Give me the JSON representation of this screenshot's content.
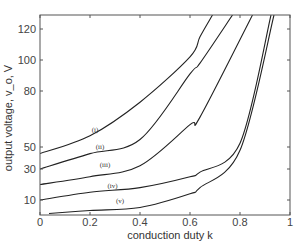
{
  "chart_data": {
    "type": "line",
    "title": "",
    "xlabel": "conduction duty k",
    "ylabel": "output voltage, v_o, V",
    "xlim": [
      0,
      1
    ],
    "ylim": [
      0,
      128
    ],
    "grid": false,
    "legend": "inline curve labels",
    "x_ticks": [
      0,
      0.2,
      0.4,
      0.6,
      0.8,
      1
    ],
    "x_tick_labels": [
      "0",
      "0.2",
      "0.4",
      "0.6",
      "0.8",
      "1"
    ],
    "y_ticks": [
      10,
      30,
      50,
      80,
      100,
      120
    ],
    "y_tick_labels": [
      "10",
      "30",
      "50",
      "80",
      "100",
      "120"
    ],
    "series": [
      {
        "name": "(i)",
        "label_pos": [
          0.22,
          58
        ],
        "points": [
          [
            0,
            44
          ],
          [
            0.2,
            56
          ],
          [
            0.4,
            74
          ],
          [
            0.6,
            102
          ],
          [
            0.64,
            115
          ],
          [
            0.69,
            128
          ]
        ]
      },
      {
        "name": "(ii)",
        "label_pos": [
          0.24,
          48
        ],
        "points": [
          [
            0,
            30
          ],
          [
            0.2,
            44
          ],
          [
            0.4,
            54
          ],
          [
            0.6,
            91
          ],
          [
            0.64,
            98
          ],
          [
            0.77,
            128
          ]
        ]
      },
      {
        "name": "(iii)",
        "label_pos": [
          0.26,
          32
        ],
        "points": [
          [
            0,
            20
          ],
          [
            0.2,
            25
          ],
          [
            0.4,
            33
          ],
          [
            0.6,
            62
          ],
          [
            0.64,
            66
          ],
          [
            0.85,
            128
          ]
        ]
      },
      {
        "name": "(iv)",
        "label_pos": [
          0.29,
          18
        ],
        "points": [
          [
            0,
            10
          ],
          [
            0.2,
            15
          ],
          [
            0.4,
            18
          ],
          [
            0.6,
            25
          ],
          [
            0.64,
            28
          ],
          [
            0.8,
            52
          ],
          [
            0.924,
            128
          ]
        ]
      },
      {
        "name": "(v)",
        "label_pos": [
          0.32,
          8
        ],
        "points": [
          [
            0.036,
            1
          ],
          [
            0.2,
            3
          ],
          [
            0.4,
            5
          ],
          [
            0.6,
            14
          ],
          [
            0.64,
            18
          ],
          [
            0.8,
            47
          ],
          [
            0.936,
            128
          ]
        ]
      }
    ]
  }
}
